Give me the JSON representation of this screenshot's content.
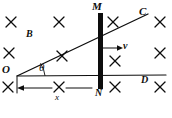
{
  "figure": {
    "type": "physics-diagram",
    "background_color": "#ffffff",
    "ink_color": "#0d0d0d",
    "labels": {
      "rod_top": "M",
      "rod_bottom": "N",
      "rail_upper_end": "C",
      "rail_lower_end": "D",
      "origin": "O",
      "field": "B",
      "velocity": "v",
      "angle": "θ",
      "distance": "x"
    },
    "field_marks": {
      "symbol": "×",
      "meaning": "magnetic-field-into-page",
      "positions": [
        {
          "x": 11,
          "y": 22
        },
        {
          "x": 59,
          "y": 22
        },
        {
          "x": 113,
          "y": 22
        },
        {
          "x": 160,
          "y": 22
        },
        {
          "x": 9,
          "y": 53
        },
        {
          "x": 62,
          "y": 56
        },
        {
          "x": 115,
          "y": 61
        },
        {
          "x": 160,
          "y": 53
        },
        {
          "x": 8,
          "y": 87
        },
        {
          "x": 59,
          "y": 87
        },
        {
          "x": 115,
          "y": 87
        },
        {
          "x": 160,
          "y": 87
        }
      ]
    },
    "geometry": {
      "origin_point": {
        "x": 17,
        "y": 76
      },
      "rail_oc": {
        "x1": 17,
        "y1": 76,
        "x2": 148,
        "y2": 14
      },
      "rail_od": {
        "x1": 17,
        "y1": 76,
        "x2": 166,
        "y2": 75
      },
      "rod": {
        "x": 98,
        "y_top": 13,
        "y_bottom": 89,
        "width": 5
      },
      "velocity_arrow": {
        "x1": 101,
        "y1": 48,
        "x2": 122,
        "y2": 48
      },
      "dimension_line": {
        "x1": 17,
        "y1": 88,
        "x2": 98,
        "y2": 88,
        "arrow_end": "left"
      },
      "angle_arc": {
        "center": {
          "x": 17,
          "y": 76
        },
        "radius": 26
      }
    }
  }
}
